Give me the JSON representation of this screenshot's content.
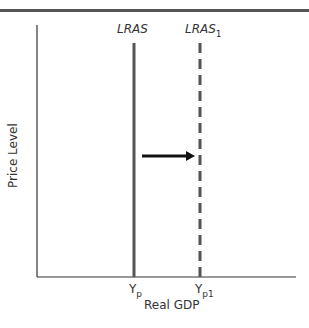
{
  "diagram": {
    "title": "",
    "axes": {
      "x_label": "Real GDP",
      "y_label": "Price Level"
    },
    "curves": [
      {
        "name": "LRAS",
        "subscript": "",
        "style": "solid",
        "x_tick": "Y",
        "x_tick_sub": "p"
      },
      {
        "name": "LRAS",
        "subscript": "1",
        "style": "dashed",
        "x_tick": "Y",
        "x_tick_sub": "p1"
      }
    ],
    "arrow": {
      "direction": "right",
      "meaning": "shift of LRAS to LRAS1"
    },
    "colors": {
      "lines": "#555555",
      "arrow": "#111111",
      "axis": "#333333"
    }
  }
}
